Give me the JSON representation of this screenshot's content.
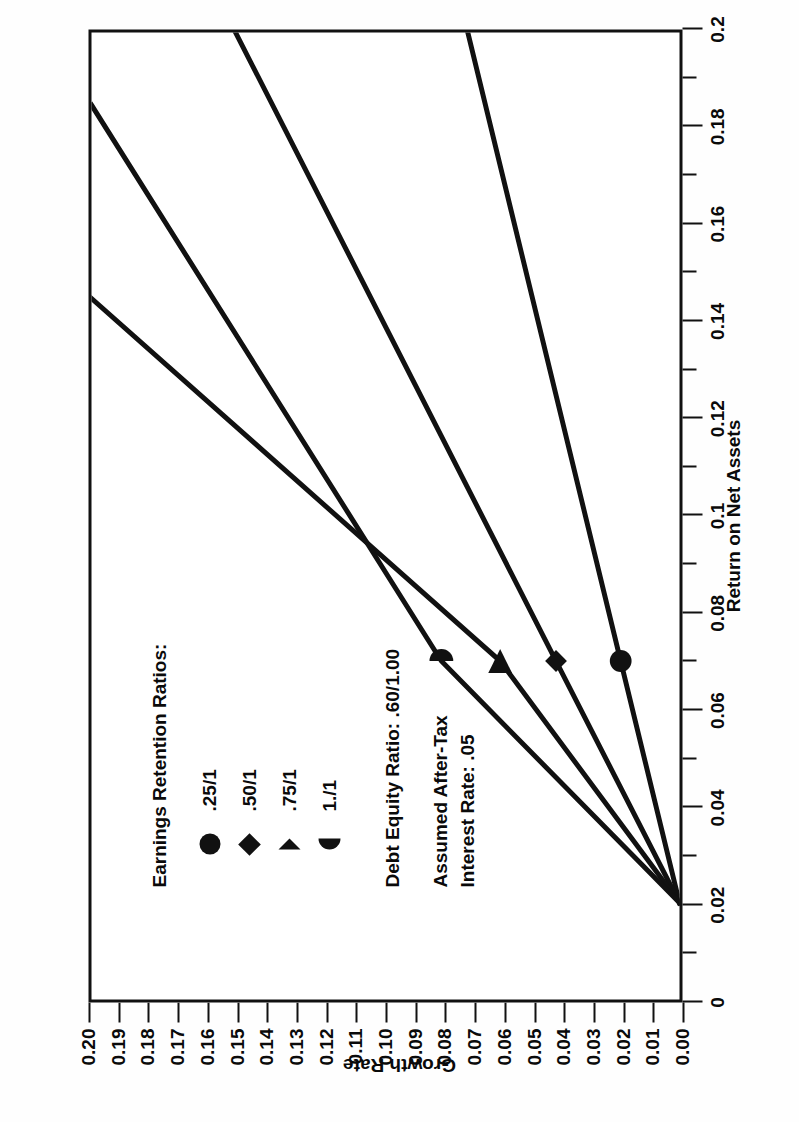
{
  "chart_data": {
    "type": "line",
    "title": "",
    "xlabel": "Return on Net Assets",
    "ylabel": "Growth Rate",
    "xlim": [
      0,
      0.2
    ],
    "ylim": [
      0,
      0.2
    ],
    "grid": false,
    "legend_position": "inside-upper-left",
    "x_ticks": [
      "0",
      "0.02",
      "0.04",
      "0.06",
      "0.08",
      "0.1",
      "0.12",
      "0.14",
      "0.16",
      "0.18",
      "0.2"
    ],
    "x_tick_values": [
      0,
      0.02,
      0.04,
      0.06,
      0.08,
      0.1,
      0.12,
      0.14,
      0.16,
      0.18,
      0.2
    ],
    "y_ticks": [
      "0.00",
      "0.01",
      "0.02",
      "0.03",
      "0.04",
      "0.05",
      "0.06",
      "0.07",
      "0.08",
      "0.09",
      "0.10",
      "0.11",
      "0.12",
      "0.13",
      "0.14",
      "0.15",
      "0.16",
      "0.17",
      "0.18",
      "0.19",
      "0.20"
    ],
    "y_tick_values": [
      0,
      0.01,
      0.02,
      0.03,
      0.04,
      0.05,
      0.06,
      0.07,
      0.08,
      0.09,
      0.1,
      0.11,
      0.12,
      0.13,
      0.14,
      0.15,
      0.16,
      0.17,
      0.18,
      0.19,
      0.2
    ],
    "convergence_point": {
      "x": 0.02,
      "y": 0.0
    },
    "marker_x": 0.07,
    "series": [
      {
        "name": ".25/1",
        "marker": "circle",
        "points": [
          {
            "x": 0.02,
            "y": 0.0
          },
          {
            "x": 0.07,
            "y": 0.02
          },
          {
            "x": 0.2,
            "y": 0.072
          }
        ],
        "marker_point": {
          "x": 0.07,
          "y": 0.02
        }
      },
      {
        "name": ".50/1",
        "marker": "diamond",
        "points": [
          {
            "x": 0.02,
            "y": 0.0
          },
          {
            "x": 0.07,
            "y": 0.042
          },
          {
            "x": 0.2,
            "y": 0.151
          }
        ],
        "marker_point": {
          "x": 0.07,
          "y": 0.042
        }
      },
      {
        "name": ".75/1",
        "marker": "triangle",
        "points": [
          {
            "x": 0.02,
            "y": 0.0
          },
          {
            "x": 0.07,
            "y": 0.061
          },
          {
            "x": 0.145,
            "y": 0.2
          }
        ],
        "marker_point": {
          "x": 0.07,
          "y": 0.061
        }
      },
      {
        "name": "1./1",
        "marker": "half-circle",
        "points": [
          {
            "x": 0.02,
            "y": 0.0
          },
          {
            "x": 0.07,
            "y": 0.081
          },
          {
            "x": 0.185,
            "y": 0.2
          }
        ],
        "marker_point": {
          "x": 0.07,
          "y": 0.081
        }
      }
    ],
    "annotations": [
      "Debt Equity Ratio: .60/1.00",
      "Assumed After-Tax",
      "Interest Rate: .05"
    ]
  },
  "legend": {
    "title": "Earnings Retention Ratios:",
    "items": [
      {
        "label": ".25/1",
        "symbol": "circle-marker-icon"
      },
      {
        "label": ".50/1",
        "symbol": "diamond-marker-icon"
      },
      {
        "label": ".75/1",
        "symbol": "triangle-marker-icon"
      },
      {
        "label": "1./1",
        "symbol": "half-circle-marker-icon"
      }
    ]
  },
  "notes": {
    "debt_equity": "Debt Equity Ratio: .60/1.00",
    "assumed_line1": "Assumed After-Tax",
    "assumed_line2": "Interest Rate: .05"
  },
  "axes": {
    "x_title": "Return on Net Assets",
    "y_title": "Growth Rate"
  },
  "colors": {
    "line": "#111111",
    "axis": "#111111",
    "background": "#ffffff",
    "text": "#0a0a0a"
  }
}
